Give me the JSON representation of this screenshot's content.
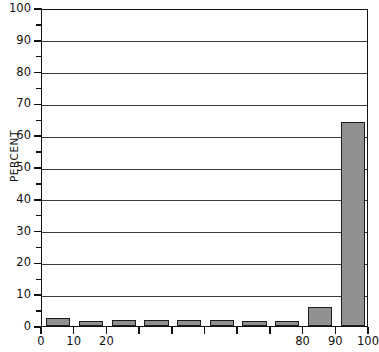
{
  "chart_data": {
    "type": "bar",
    "title": "",
    "xlabel": "",
    "ylabel": "PERCENT",
    "categories": [
      "0-10",
      "10-20",
      "20-30",
      "30-40",
      "40-50",
      "50-60",
      "60-70",
      "70-80",
      "80-90",
      "90-100"
    ],
    "bin_starts": [
      0,
      10,
      20,
      30,
      40,
      50,
      60,
      70,
      80,
      90
    ],
    "bin_width": 10,
    "values": [
      2.5,
      1.5,
      2,
      2,
      2,
      2,
      1.5,
      1.5,
      6,
      64
    ],
    "xlim": [
      0,
      100
    ],
    "ylim": [
      0,
      100
    ],
    "y_ticks": [
      0,
      10,
      20,
      30,
      40,
      50,
      60,
      70,
      80,
      90,
      100
    ],
    "y_tick_labels": [
      "0",
      "10",
      "20",
      "30",
      "40",
      "50",
      "60",
      "70",
      "80",
      "90",
      "100"
    ],
    "y_minor_tick_step": 5,
    "x_ticks": [
      0,
      10,
      20,
      30,
      40,
      50,
      60,
      70,
      80,
      90,
      100
    ],
    "x_tick_labels": [
      "0",
      "10",
      "20",
      "",
      "",
      "",
      "",
      "",
      "80",
      "90",
      "100"
    ],
    "grid": "horizontal",
    "legend": "none",
    "bar_fill_color": "#909090",
    "bar_edge_color": "#1c1c1c",
    "axis_color": "#111111",
    "background_color": "#ffffff"
  }
}
